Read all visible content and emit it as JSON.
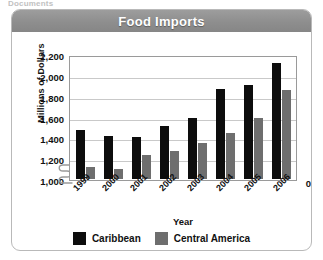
{
  "page": {
    "top_fragment": "Documents"
  },
  "card": {
    "title": "Food Imports"
  },
  "legend": {
    "items": [
      {
        "label": "Caribbean",
        "color": "#0d0d0d",
        "swatch_name": "legend-swatch-caribbean"
      },
      {
        "label": "Central America",
        "color": "#6e6e6e",
        "swatch_name": "legend-swatch-central-america"
      }
    ]
  },
  "axis": {
    "y_title": "Millions of Dollars",
    "x_title": "Year",
    "y_ticks": [
      "2,200",
      "2,000",
      "1,800",
      "1,600",
      "1,400",
      "1,200",
      "1,000"
    ],
    "y_zero_tick": "0",
    "broken": true
  },
  "chart_data": {
    "type": "bar",
    "title": "Food Imports",
    "xlabel": "Year",
    "ylabel": "Millions of Dollars",
    "categories": [
      "1999",
      "2000",
      "2001",
      "2002",
      "2003",
      "2004",
      "2005",
      "2006"
    ],
    "series": [
      {
        "name": "Caribbean",
        "color": "#0d0d0d",
        "values": [
          1480,
          1420,
          1410,
          1520,
          1600,
          1880,
          1920,
          2130
        ]
      },
      {
        "name": "Central America",
        "color": "#6e6e6e",
        "values": [
          1120,
          1100,
          1230,
          1270,
          1350,
          1450,
          1600,
          1870
        ]
      }
    ],
    "ylim": [
      1000,
      2200
    ],
    "ytick_values": [
      1000,
      1200,
      1400,
      1600,
      1800,
      2000,
      2200
    ],
    "axis_break_below": 1000,
    "grid": true,
    "legend_position": "bottom"
  }
}
